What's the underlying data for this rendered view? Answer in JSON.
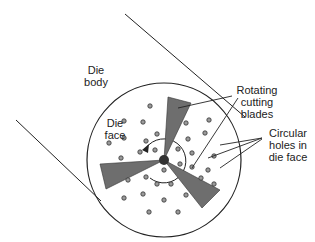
{
  "labels": {
    "die_body": [
      "Die",
      "body"
    ],
    "die_face": [
      "Die",
      "face"
    ],
    "blades": [
      "Rotating",
      "cutting",
      "blades"
    ],
    "holes": [
      "Circular",
      "holes in",
      "die face"
    ]
  },
  "colors": {
    "line": "#222222",
    "blade_fill": "#6e6e6e",
    "hole_fill": "#9a9a9a",
    "hub_fill": "#333333"
  }
}
